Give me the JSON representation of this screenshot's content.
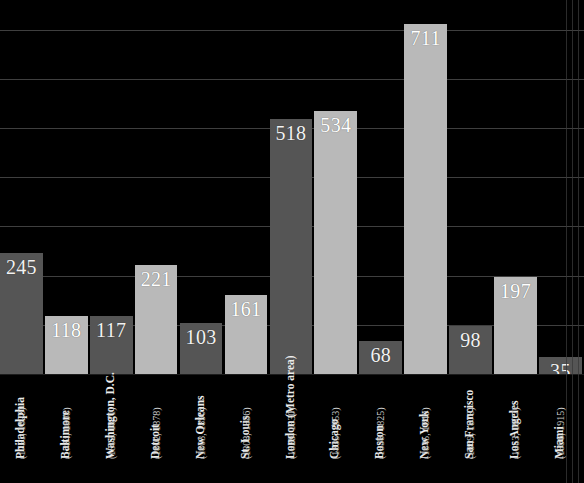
{
  "chart_data": {
    "type": "bar",
    "title": "",
    "subtitle": "",
    "xlabel": "",
    "ylabel": "",
    "grid": true,
    "legend": false,
    "ylim": [
      0,
      760
    ],
    "gridline_values": [
      100,
      200,
      300,
      400,
      500,
      600,
      700
    ],
    "categories": [
      "Philadelphia",
      "Baltimore",
      "Washington, D.C.",
      "Detroit",
      "New Orleans",
      "St. Louis",
      "London (Metro area)",
      "Chicago",
      "Boston",
      "New York",
      "San Francisco",
      "Los Angeles",
      "Miami"
    ],
    "category_years": [
      "(1751, 1828)",
      "(1784, 1808)",
      "(1802, 1871)",
      "(1802, 1878)",
      "(1803, 1890)",
      "(1808, 1836)",
      "(1829, 1830)",
      "(1835, 1853)",
      "(1838, 1825)",
      "(1845, 1849)",
      "(1849, 1878)",
      "(1853, 1907)",
      "(1896, 1915)"
    ],
    "values": [
      245,
      118,
      117,
      221,
      103,
      161,
      518,
      534,
      68,
      711,
      98,
      197,
      35
    ],
    "value_labels": [
      "245",
      "118",
      "117",
      "221",
      "103",
      "161",
      "518",
      "534",
      "68",
      "711",
      "98",
      "197",
      "35"
    ],
    "bar_shades": [
      "dark",
      "light",
      "dark",
      "light",
      "dark",
      "light",
      "dark",
      "light",
      "dark",
      "light",
      "dark",
      "light",
      "dark"
    ]
  },
  "colors": {
    "background": "#000000",
    "bar_dark": "#555555",
    "bar_light": "#b9b9b9",
    "gridline": "#4a4a4a",
    "value_text": "#ffffff",
    "label_text": "#ececec",
    "year_text": "#c9c9c9"
  }
}
